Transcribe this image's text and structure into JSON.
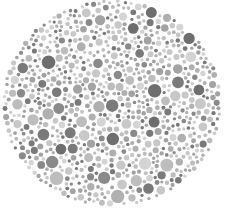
{
  "image": {
    "subject": "Ishihara-style color vision test plate (grayscale)",
    "width": 228,
    "height": 210,
    "background": "#ffffff"
  },
  "plate": {
    "center": [
      112,
      103
    ],
    "radius_x": 110,
    "radius_y": 104,
    "palette": [
      "#c8c8c8",
      "#bdbdbd",
      "#b0b0b0",
      "#a3a3a3",
      "#8a8a8a",
      "#7a7a7a",
      "#d4d4d4",
      "#6e6e6e"
    ],
    "dot_count": 1400,
    "seed": 7
  }
}
